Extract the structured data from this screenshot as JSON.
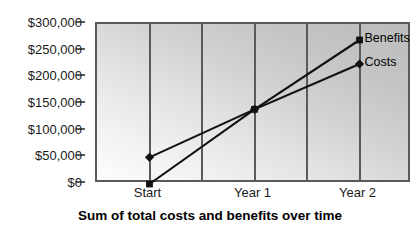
{
  "chart_data": {
    "type": "line",
    "title": "Sum of total costs and benefits over time",
    "xlabel": "",
    "ylabel": "",
    "categories": [
      "Start",
      "Year 1",
      "Year 2"
    ],
    "series": [
      {
        "name": "Benefits",
        "marker": "square",
        "values": [
          0,
          140000,
          270000
        ],
        "color": "#111111"
      },
      {
        "name": "Costs",
        "marker": "diamond",
        "values": [
          50000,
          140000,
          225000
        ],
        "color": "#111111"
      }
    ],
    "ylim": [
      0,
      300000
    ],
    "ytick_values": [
      0,
      50000,
      100000,
      150000,
      200000,
      250000,
      300000
    ],
    "ytick_labels": [
      "$0",
      "$50,000",
      "$100,000",
      "$150,000",
      "$200,000",
      "$250,000",
      "$300,000"
    ],
    "grid": "vertical",
    "gridline_count": 6,
    "legend_position": "inline-right",
    "plot_background": "diagonal gradient light-gray to gray",
    "colors": {
      "axis": "#5a5a5a",
      "line": "#111111",
      "text": "#1a1a1a",
      "plot_bg_light": "#fdfdfd",
      "plot_bg_dark": "#bcbcbc"
    }
  }
}
